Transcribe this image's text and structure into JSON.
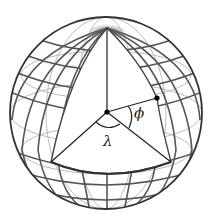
{
  "diagram": {
    "type": "sphere-coordinates",
    "labels": {
      "longitude": "λ",
      "latitude": "ϕ"
    },
    "colors": {
      "outline": "#333333",
      "grid": "#555555",
      "grid_faint": "#aaaaaa",
      "cut_face": "#ffffff",
      "point": "#000000"
    },
    "geometry": {
      "center": [
        106,
        113
      ],
      "radius": 97,
      "north_pole": [
        107,
        28
      ],
      "origin_point": [
        107,
        112
      ],
      "surface_point": [
        157,
        98
      ],
      "equator_left": [
        51,
        162
      ],
      "equator_right": [
        171,
        162
      ]
    }
  }
}
